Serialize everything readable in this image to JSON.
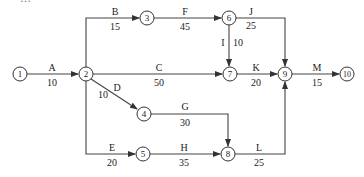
{
  "diagram": {
    "type": "activity-on-arrow network",
    "colors": {
      "line": "#333333",
      "node_fill": "#ffffff",
      "text": "#222222"
    },
    "top_cut_text": "…",
    "nodes": [
      {
        "id": "1",
        "label": "1",
        "x": 20,
        "y": 74
      },
      {
        "id": "2",
        "label": "2",
        "x": 86,
        "y": 74
      },
      {
        "id": "3",
        "label": "3",
        "x": 147,
        "y": 18
      },
      {
        "id": "4",
        "label": "4",
        "x": 144,
        "y": 114
      },
      {
        "id": "5",
        "label": "5",
        "x": 143,
        "y": 154
      },
      {
        "id": "6",
        "label": "6",
        "x": 229,
        "y": 18
      },
      {
        "id": "7",
        "label": "7",
        "x": 230,
        "y": 74
      },
      {
        "id": "8",
        "label": "8",
        "x": 228,
        "y": 154
      },
      {
        "id": "9",
        "label": "9",
        "x": 285,
        "y": 74
      },
      {
        "id": "10",
        "label": "10",
        "x": 347,
        "y": 74
      }
    ],
    "activities": [
      {
        "name": "A",
        "duration": "10",
        "from": "1",
        "to": "2"
      },
      {
        "name": "B",
        "duration": "15",
        "from": "2",
        "to": "3"
      },
      {
        "name": "C",
        "duration": "50",
        "from": "2",
        "to": "7"
      },
      {
        "name": "D",
        "duration": "10",
        "from": "2",
        "to": "4"
      },
      {
        "name": "E",
        "duration": "20",
        "from": "2",
        "to": "5"
      },
      {
        "name": "F",
        "duration": "45",
        "from": "3",
        "to": "6"
      },
      {
        "name": "G",
        "duration": "30",
        "from": "4",
        "to": "8"
      },
      {
        "name": "H",
        "duration": "35",
        "from": "5",
        "to": "8"
      },
      {
        "name": "I",
        "duration": "10",
        "from": "6",
        "to": "7"
      },
      {
        "name": "J",
        "duration": "25",
        "from": "6",
        "to": "9"
      },
      {
        "name": "K",
        "duration": "20",
        "from": "7",
        "to": "9"
      },
      {
        "name": "L",
        "duration": "25",
        "from": "8",
        "to": "9"
      },
      {
        "name": "M",
        "duration": "15",
        "from": "9",
        "to": "10"
      }
    ]
  }
}
